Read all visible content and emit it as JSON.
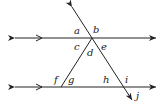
{
  "diagram": {
    "line_color": "#222222",
    "angle_labels": {
      "a": "a",
      "b": "b",
      "c": "c",
      "d": "d",
      "e": "e",
      "f": "f",
      "g": "g",
      "h": "h",
      "i": "i",
      "j": "j"
    }
  }
}
